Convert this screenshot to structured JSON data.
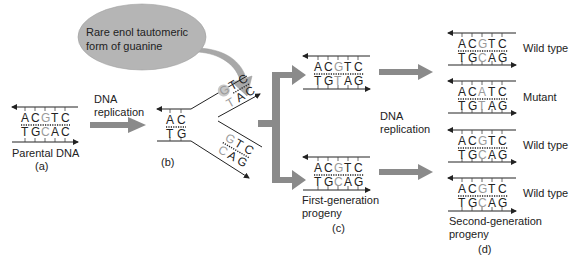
{
  "colors": {
    "arrow_gray": "#8a8a8a",
    "bubble_gray": "#b5b5b5",
    "highlight_base": "#9a9a9a",
    "text": "#222222"
  },
  "callout": {
    "line1": "Rare enol tautomeric",
    "line2": "form of guanine"
  },
  "labels": {
    "dna_replication_1_line1": "DNA",
    "dna_replication_1_line2": "replication",
    "dna_replication_2_line1": "DNA",
    "dna_replication_2_line2": "replication"
  },
  "panels": {
    "a": {
      "caption": "Parental DNA",
      "letter": "(a)",
      "top": [
        "A",
        "C",
        "G",
        "T",
        "C"
      ],
      "bottom": [
        "T",
        "G",
        "C",
        "A",
        "C"
      ]
    },
    "b": {
      "letter": "(b)",
      "stem_top": [
        "A",
        "C"
      ],
      "stem_bottom": [
        "T",
        "G"
      ],
      "upper_fork_top": [
        "G",
        "T",
        "C"
      ],
      "upper_fork_bottom": [
        "T",
        "A",
        "C"
      ],
      "lower_fork_top": [
        "G",
        "T",
        "C"
      ],
      "lower_fork_bottom": [
        "C",
        "A",
        "G"
      ]
    },
    "c": {
      "caption_line1": "First-generation",
      "caption_line2": "progeny",
      "letter": "(c)",
      "upper": {
        "top": [
          "A",
          "C",
          "G",
          "T",
          "C"
        ],
        "bottom": [
          "T",
          "G",
          "T",
          "A",
          "G"
        ]
      },
      "lower": {
        "top": [
          "A",
          "C",
          "G",
          "T",
          "C"
        ],
        "bottom": [
          "T",
          "G",
          "C",
          "A",
          "G"
        ]
      }
    },
    "d": {
      "caption_line1": "Second-generation",
      "caption_line2": "progeny",
      "letter": "(d)",
      "rows": [
        {
          "label": "Wild type",
          "top": [
            "A",
            "C",
            "G",
            "T",
            "C"
          ],
          "bottom": [
            "T",
            "G",
            "C",
            "A",
            "G"
          ]
        },
        {
          "label": "Mutant",
          "top": [
            "A",
            "C",
            "A",
            "T",
            "C"
          ],
          "bottom": [
            "T",
            "G",
            "T",
            "A",
            "G"
          ]
        },
        {
          "label": "Wild type",
          "top": [
            "A",
            "C",
            "G",
            "T",
            "C"
          ],
          "bottom": [
            "T",
            "G",
            "C",
            "A",
            "G"
          ]
        },
        {
          "label": "Wild type",
          "top": [
            "A",
            "C",
            "G",
            "T",
            "C"
          ],
          "bottom": [
            "T",
            "G",
            "C",
            "A",
            "G"
          ]
        }
      ]
    }
  }
}
